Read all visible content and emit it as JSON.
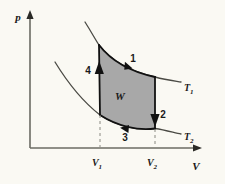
{
  "figure": {
    "background_color": "#faf9f3"
  },
  "axes": {
    "y_label": "p",
    "x_label": "V",
    "axis_color": "#6b6b63",
    "origin": {
      "x": 30,
      "y": 148
    },
    "y_top": 12,
    "x_right": 200
  },
  "ticks": [
    {
      "name": "V1",
      "base": "V",
      "sub": "1",
      "x": 100
    },
    {
      "name": "V2",
      "base": "V",
      "sub": "2",
      "x": 155
    }
  ],
  "isotherms": [
    {
      "name": "T1",
      "base": "T",
      "sub": "1",
      "label_x": 185,
      "label_y": 91,
      "color": "#4a4a44"
    },
    {
      "name": "T2",
      "base": "T",
      "sub": "2",
      "label_x": 185,
      "label_y": 140,
      "color": "#4a4a44"
    }
  ],
  "cycle": {
    "fill_color": "#a8a8a8",
    "stroke_color": "#1a1a1a",
    "work_label": "W",
    "work_label_x": 120,
    "work_label_y": 100,
    "corners": {
      "top_left": {
        "x": 99,
        "y": 45
      },
      "top_right": {
        "x": 155,
        "y": 77
      },
      "bottom_right": {
        "x": 155,
        "y": 128
      },
      "bottom_left": {
        "x": 100,
        "y": 115
      }
    }
  },
  "steps": [
    {
      "id": "1",
      "label": "1",
      "label_x": 133,
      "label_y": 62,
      "direction": "right",
      "description": "isothermal expansion along T1"
    },
    {
      "id": "2",
      "label": "2",
      "label_x": 163,
      "label_y": 118,
      "direction": "down",
      "description": "adiabatic cooling"
    },
    {
      "id": "3",
      "label": "3",
      "label_x": 125,
      "label_y": 137,
      "direction": "left",
      "description": "isothermal compression along T2"
    },
    {
      "id": "4",
      "label": "4",
      "label_x": 88,
      "label_y": 74,
      "direction": "up",
      "description": "adiabatic heating"
    }
  ]
}
